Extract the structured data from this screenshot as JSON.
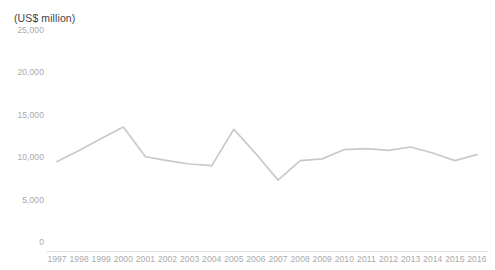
{
  "chart_data": {
    "type": "line",
    "title": "(US$ million)",
    "xlabel": "",
    "ylabel": "(US$ million)",
    "categories": [
      "1997",
      "1998",
      "1999",
      "2000",
      "2001",
      "2002",
      "2003",
      "2004",
      "2005",
      "2006",
      "2007",
      "2008",
      "2009",
      "2010",
      "2011",
      "2012",
      "2013",
      "2014",
      "2015",
      "2016"
    ],
    "values": [
      9500,
      10800,
      12200,
      13550,
      10050,
      9600,
      9200,
      9000,
      13300,
      10400,
      7300,
      9600,
      9800,
      10900,
      11000,
      10800,
      11200,
      10500,
      9600,
      10300
    ],
    "series": [
      {
        "name": "Value",
        "values": [
          9500,
          10800,
          12200,
          13550,
          10050,
          9600,
          9200,
          9000,
          13300,
          10400,
          7300,
          9600,
          9800,
          10900,
          11000,
          10800,
          11200,
          10500,
          9600,
          10300
        ]
      }
    ],
    "ylim": [
      0,
      25000
    ],
    "y_ticks": [
      0,
      5000,
      10000,
      15000,
      20000,
      25000
    ],
    "y_tick_labels": [
      "0",
      "5,000",
      "10,000",
      "15,000",
      "20,000",
      "25,000"
    ],
    "grid": false,
    "legend": false,
    "legend_position": "none",
    "line_color": "#c9c9c9",
    "axis_color": "#e3e3e3",
    "tick_label_color": "#a9a9a9",
    "title_color": "#3f3f3f"
  }
}
